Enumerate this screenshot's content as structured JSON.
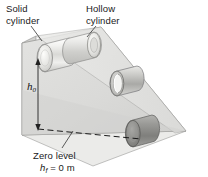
{
  "figure": {
    "type": "physics-diagram",
    "labels": {
      "solid_cylinder_line1": "Solid",
      "solid_cylinder_line2": "cylinder",
      "hollow_cylinder_line1": "Hollow",
      "hollow_cylinder_line2": "cylinder",
      "zero_level": "Zero level",
      "h_final_symbol": "h",
      "h_final_subscript": "f",
      "h_final_value": " = 0 m",
      "height_symbol": "h",
      "height_subscript": "0"
    },
    "colors": {
      "ramp_top": "#dcdcda",
      "ramp_side": "#c9c9c7",
      "ramp_front": "#e6e6e4",
      "cylinder_light": "#ededeb",
      "cylinder_mid": "#b9b9b7",
      "cylinder_dark": "#8e8e8c",
      "outline": "#6e6e6c",
      "text": "#1a1a1a",
      "background": "#ffffff"
    },
    "objects": [
      {
        "name": "solid-cylinder-top",
        "position": "top-of-incline-left",
        "shade": "light"
      },
      {
        "name": "hollow-cylinder-top",
        "position": "top-of-incline-right",
        "shade": "light"
      },
      {
        "name": "hollow-cylinder-middle",
        "position": "mid-incline",
        "shade": "open-ended-ring"
      },
      {
        "name": "solid-cylinder-bottom",
        "position": "bottom-of-incline",
        "shade": "dark"
      }
    ],
    "annotations": [
      {
        "name": "height-arrow",
        "kind": "double-headed-vertical-arrow",
        "measures": "h_0"
      },
      {
        "name": "zero-level-line",
        "kind": "dashed-horizontal-line"
      },
      {
        "name": "solid-leader",
        "kind": "leader-line"
      },
      {
        "name": "hollow-leader",
        "kind": "leader-line"
      },
      {
        "name": "zero-level-leader",
        "kind": "leader-line"
      }
    ]
  }
}
